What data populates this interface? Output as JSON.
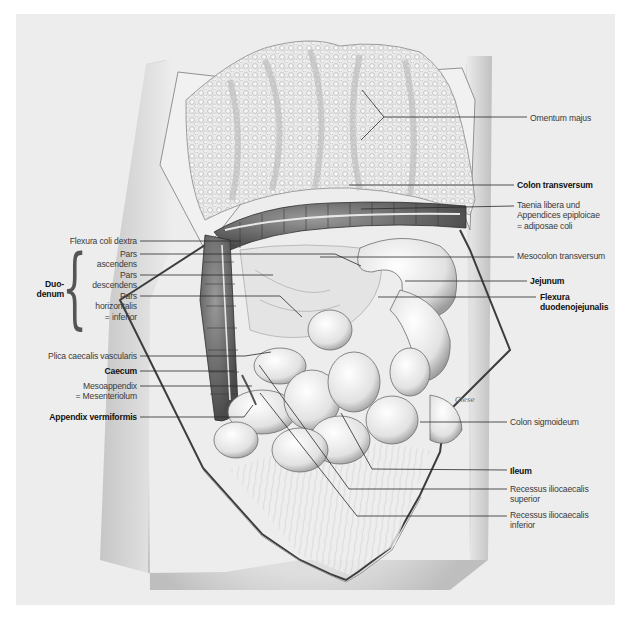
{
  "figure": {
    "background_color": "#ededed",
    "line_color": "#2a2a2a"
  },
  "labels_left": [
    {
      "id": "flexura-coli-dextra",
      "text": "Flexura coli dextra",
      "bold": false,
      "x": 18,
      "y": 236,
      "w": 119,
      "anchor": "right",
      "line": {
        "x1": 140,
        "y1": 241,
        "x2": 241,
        "y2": 241
      }
    },
    {
      "id": "pars-ascendens",
      "text": "Pars\nascendens",
      "bold": false,
      "x": 70,
      "y": 249,
      "w": 67,
      "anchor": "right",
      "line": {
        "x1": 140,
        "y1": 254,
        "x2": 335,
        "y2": 254,
        "x3": 361,
        "y3": 266
      }
    },
    {
      "id": "pars-descendens",
      "text": "Pars\ndescendens",
      "bold": false,
      "x": 70,
      "y": 270,
      "w": 67,
      "anchor": "right",
      "line": {
        "x1": 140,
        "y1": 275,
        "x2": 273,
        "y2": 275
      }
    },
    {
      "id": "pars-horizontalis",
      "text": "Pars\nhorizontalis\n= inferior",
      "bold": false,
      "x": 70,
      "y": 291,
      "w": 67,
      "anchor": "right",
      "line": {
        "x1": 140,
        "y1": 296,
        "x2": 280,
        "y2": 296,
        "x3": 302,
        "y3": 317
      }
    },
    {
      "id": "plica-caecalis",
      "text": "Plica caecalis vascularis",
      "bold": false,
      "x": 18,
      "y": 351,
      "w": 119,
      "anchor": "right",
      "line": {
        "x1": 140,
        "y1": 356,
        "x2": 245,
        "y2": 356,
        "x3": 271,
        "y3": 352
      }
    },
    {
      "id": "caecum",
      "text": "Caecum",
      "bold": true,
      "x": 18,
      "y": 366,
      "w": 119,
      "anchor": "right",
      "line": {
        "x1": 140,
        "y1": 371,
        "x2": 234,
        "y2": 371
      }
    },
    {
      "id": "mesoappendix",
      "text": "Mesoappendix\n= Mesenteriolum",
      "bold": false,
      "x": 18,
      "y": 381,
      "w": 119,
      "anchor": "right",
      "line": {
        "x1": 140,
        "y1": 386,
        "x2": 252,
        "y2": 386
      }
    },
    {
      "id": "appendix-vermiformis",
      "text": "Appendix vermiformis",
      "bold": true,
      "x": 18,
      "y": 412,
      "w": 119,
      "anchor": "right",
      "line": {
        "x1": 140,
        "y1": 417,
        "x2": 244,
        "y2": 417,
        "x3": 253,
        "y3": 405
      }
    }
  ],
  "brace_group": {
    "text": "Duo-\ndenum",
    "bold": true,
    "x": 34,
    "y": 279
  },
  "labels_right": [
    {
      "id": "omentum-majus",
      "text": "Omentum majus",
      "bold": false,
      "x": 530,
      "y": 113,
      "line": {
        "x1": 384,
        "y1": 117,
        "x2": 527,
        "y2": 117
      }
    },
    {
      "id": "colon-transversum",
      "text": "Colon transversum",
      "bold": true,
      "x": 517,
      "y": 180,
      "line": {
        "x1": 349,
        "y1": 185,
        "x2": 514,
        "y2": 185
      }
    },
    {
      "id": "taenia-libera",
      "text": "Taenia libera und\nAppendices epiploicae\n= adiposae coli",
      "bold": false,
      "x": 517,
      "y": 200,
      "line": {
        "x1": 361,
        "y1": 209,
        "x2": 514,
        "y2": 206
      }
    },
    {
      "id": "mesocolon-transversum",
      "text": "Mesocolon transversum",
      "bold": false,
      "x": 517,
      "y": 251,
      "line": {
        "x1": 320,
        "y1": 257,
        "x2": 514,
        "y2": 257
      }
    },
    {
      "id": "jejunum",
      "text": "Jejunum",
      "bold": true,
      "x": 530,
      "y": 276,
      "line": {
        "x1": 405,
        "y1": 281,
        "x2": 527,
        "y2": 281
      }
    },
    {
      "id": "flexura-duodenojejunalis",
      "text": "Flexura\nduodenojejunalis",
      "bold": true,
      "x": 540,
      "y": 292,
      "line": {
        "x1": 378,
        "y1": 297,
        "x2": 536,
        "y2": 297
      }
    },
    {
      "id": "colon-sigmoideum",
      "text": "Colon sigmoideum",
      "bold": false,
      "x": 510,
      "y": 417,
      "line": {
        "x1": 420,
        "y1": 422,
        "x2": 507,
        "y2": 422
      }
    },
    {
      "id": "ileum",
      "text": "Ileum",
      "bold": true,
      "x": 510,
      "y": 466,
      "line": {
        "x1": 341,
        "y1": 413,
        "x2": 372,
        "y2": 469,
        "x3": 507,
        "y3": 470
      }
    },
    {
      "id": "recessus-superior",
      "text": "Recessus iliocaecalis\nsuperior",
      "bold": false,
      "x": 510,
      "y": 484,
      "line": {
        "x1": 259,
        "y1": 365,
        "x2": 349,
        "y2": 489,
        "x3": 507,
        "y3": 489
      }
    },
    {
      "id": "recessus-inferior",
      "text": "Recessus iliocaecalis\ninferior",
      "bold": false,
      "x": 510,
      "y": 510,
      "line": {
        "x1": 260,
        "y1": 393,
        "x2": 357,
        "y2": 516,
        "x3": 507,
        "y3": 516
      }
    }
  ],
  "omentum_branches": [
    {
      "x1": 384,
      "y1": 117,
      "x2": 362,
      "y2": 90
    },
    {
      "x1": 384,
      "y1": 117,
      "x2": 361,
      "y2": 140
    }
  ],
  "signature": "Giese"
}
